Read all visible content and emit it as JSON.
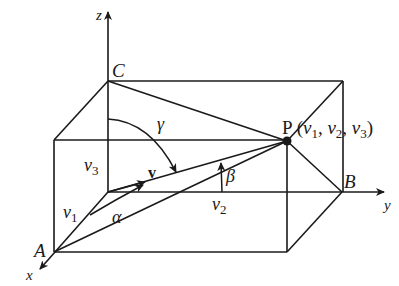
{
  "figure": {
    "labels": {
      "z_axis": "z",
      "y_axis": "y",
      "x_axis": "x",
      "point_C": "C",
      "point_A": "A",
      "point_B": "B",
      "point_P": "P",
      "point_P_coords": "(v1, v2, v3)",
      "v1": "v",
      "v1_sub": "1",
      "v2": "v",
      "v2_sub": "2",
      "v3": "v",
      "v3_sub": "3",
      "vector": "v",
      "alpha": "α",
      "beta": "β",
      "gamma": "γ",
      "P_coord_open": "(",
      "P_coord_comma1": ", ",
      "P_coord_comma2": ", ",
      "P_coord_close": ")"
    },
    "points": {
      "O": [
        108,
        192
      ],
      "C": [
        108,
        81
      ],
      "A": [
        54,
        252
      ],
      "B": [
        342,
        192
      ],
      "P": [
        287,
        141
      ],
      "top_back_right": [
        343,
        81
      ],
      "front_top_left": [
        54,
        140
      ],
      "front_bottom_right": [
        287,
        252
      ]
    },
    "colors": {
      "stroke": "#1a1a1a",
      "background": "#ffffff"
    }
  }
}
